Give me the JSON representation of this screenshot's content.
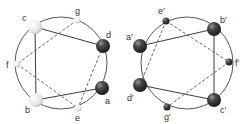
{
  "colors": {
    "circle": "#4a4a4a",
    "solid_edge": "#3c3c3c",
    "dashed_edge": "#4a4a4a",
    "light_node": "#eeeeee",
    "dark_node": "#2a2a2a"
  },
  "left_diagram": {
    "nodes": [
      {
        "id": "c",
        "label": "c",
        "x": 35,
        "y": 27,
        "r": 7,
        "shade": "light"
      },
      {
        "id": "g",
        "label": "g",
        "x": 77,
        "y": 20,
        "r": 3.5,
        "shade": "light"
      },
      {
        "id": "d",
        "label": "d",
        "x": 103,
        "y": 46,
        "r": 7,
        "shade": "dark"
      },
      {
        "id": "a",
        "label": "a",
        "x": 102,
        "y": 88,
        "r": 7,
        "shade": "dark"
      },
      {
        "id": "e",
        "label": "e",
        "x": 78,
        "y": 108,
        "r": 3.5,
        "shade": "light"
      },
      {
        "id": "b",
        "label": "b",
        "x": 36,
        "y": 100,
        "r": 7,
        "shade": "light"
      },
      {
        "id": "f",
        "label": "f",
        "x": 17,
        "y": 64,
        "r": 3.5,
        "shade": "light"
      }
    ],
    "solid_edges": [
      [
        "c",
        "d"
      ],
      [
        "c",
        "b"
      ],
      [
        "b",
        "a"
      ]
    ],
    "dashed_edges": [
      [
        "g",
        "f"
      ],
      [
        "f",
        "e"
      ],
      [
        "d",
        "e"
      ],
      [
        "c",
        "g"
      ]
    ]
  },
  "right_diagram": {
    "nodes": [
      {
        "id": "e'",
        "label": "e′",
        "x": 166,
        "y": 21,
        "r": 3.5,
        "shade": "dark"
      },
      {
        "id": "b'",
        "label": "b′",
        "x": 214,
        "y": 29,
        "r": 7,
        "shade": "dark"
      },
      {
        "id": "a'",
        "label": "a′",
        "x": 140,
        "y": 46,
        "r": 7,
        "shade": "dark"
      },
      {
        "id": "f'",
        "label": "f′",
        "x": 229,
        "y": 62,
        "r": 3.5,
        "shade": "dark"
      },
      {
        "id": "d'",
        "label": "d′",
        "x": 140,
        "y": 85,
        "r": 7,
        "shade": "dark"
      },
      {
        "id": "g'",
        "label": "g′",
        "x": 167,
        "y": 107,
        "r": 3.5,
        "shade": "dark"
      },
      {
        "id": "c'",
        "label": "c′",
        "x": 214,
        "y": 100,
        "r": 7,
        "shade": "dark"
      }
    ],
    "solid_edges": [
      [
        "a'",
        "b'"
      ],
      [
        "b'",
        "c'"
      ],
      [
        "d'",
        "c'"
      ]
    ],
    "dashed_edges": [
      [
        "e'",
        "f'"
      ],
      [
        "e'",
        "d'"
      ],
      [
        "f'",
        "g'"
      ]
    ]
  },
  "labels": {
    "c": "c",
    "g": "g",
    "d": "d",
    "a": "a",
    "e": "e",
    "b": "b",
    "f": "f",
    "e_p": "e′",
    "b_p": "b′",
    "a_p": "a′",
    "f_p": "f′",
    "d_p": "d′",
    "g_p": "g′",
    "c_p": "c′"
  }
}
